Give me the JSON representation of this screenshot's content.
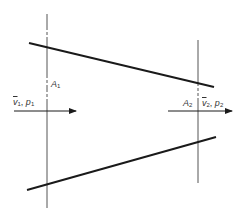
{
  "diagram": {
    "type": "converging-duct-flow",
    "colors": {
      "wall": "#1a1a1a",
      "axis": "#555555",
      "text": "#333333",
      "background": "#ffffff"
    },
    "walls": {
      "upper": {
        "x1": 29,
        "y1": 43,
        "x2": 214,
        "y2": 87
      },
      "lower": {
        "x1": 27,
        "y1": 190,
        "x2": 216,
        "y2": 137
      }
    },
    "sections": [
      {
        "name": "section-1",
        "x": 47,
        "y_top": 14,
        "y_bottom": 208
      },
      {
        "name": "section-2",
        "x": 198,
        "y_top": 40,
        "y_bottom": 183
      }
    ],
    "arrows": [
      {
        "name": "flow-arrow-1",
        "x1": 14,
        "x2": 76,
        "y": 111
      },
      {
        "name": "flow-arrow-2",
        "x1": 168,
        "x2": 232,
        "y": 111
      }
    ],
    "labels": {
      "area1": {
        "base": "A",
        "sub": "1"
      },
      "state1": {
        "v": "v",
        "v_sub": "1",
        "sep": ", ",
        "p": "p",
        "p_sub": "1"
      },
      "area2": {
        "base": "A",
        "sub": "2"
      },
      "state2": {
        "v": "v",
        "v_sub": "2",
        "sep": ", ",
        "p": "p",
        "p_sub": "2"
      }
    }
  }
}
